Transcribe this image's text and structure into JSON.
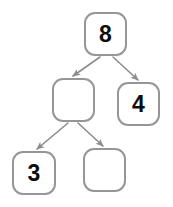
{
  "diagram": {
    "kind": "binary-tree",
    "canvas": {
      "width": 173,
      "height": 207,
      "background": "#ffffff"
    },
    "style": {
      "node_border_color": "#969696",
      "node_fill_color": "#ffffff",
      "node_border_width": 2,
      "node_corner_radius": 11,
      "edge_color": "#8c8c8c",
      "edge_width": 1.6,
      "label_color": "#0d0d0d",
      "label_font_size": 23
    },
    "nodes": [
      {
        "id": "root",
        "name": "node-root",
        "label": "8",
        "filled": true,
        "x": 84,
        "y": 12,
        "width": 43,
        "height": 44
      },
      {
        "id": "mid-left",
        "name": "node-mid-left",
        "label": "",
        "filled": false,
        "x": 52,
        "y": 78,
        "width": 43,
        "height": 44
      },
      {
        "id": "mid-right",
        "name": "node-mid-right",
        "label": "4",
        "filled": true,
        "x": 117,
        "y": 82,
        "width": 43,
        "height": 44
      },
      {
        "id": "bottom-left",
        "name": "node-bottom-left",
        "label": "3",
        "filled": true,
        "x": 12,
        "y": 151,
        "width": 44,
        "height": 44
      },
      {
        "id": "bottom-right",
        "name": "node-bottom-right",
        "label": "",
        "filled": false,
        "x": 83,
        "y": 148,
        "width": 43,
        "height": 44
      }
    ],
    "edges": [
      {
        "id": "edge-root-midleft",
        "name": "edge-root-to-mid-left",
        "from": "root",
        "to": "mid-left",
        "x1": 100,
        "y1": 57,
        "x2": 73,
        "y2": 76,
        "arrowhead": true
      },
      {
        "id": "edge-root-midright",
        "name": "edge-root-to-mid-right",
        "from": "root",
        "to": "mid-right",
        "x1": 113,
        "y1": 57,
        "x2": 138,
        "y2": 80,
        "arrowhead": true
      },
      {
        "id": "edge-midleft-bottomleft",
        "name": "edge-mid-left-to-bottom-left",
        "from": "mid-left",
        "to": "bottom-left",
        "x1": 68,
        "y1": 123,
        "x2": 37,
        "y2": 149,
        "arrowhead": true
      },
      {
        "id": "edge-midleft-bottomright",
        "name": "edge-mid-left-to-bottom-right",
        "from": "mid-left",
        "to": "bottom-right",
        "x1": 78,
        "y1": 123,
        "x2": 103,
        "y2": 146,
        "arrowhead": true
      }
    ]
  }
}
